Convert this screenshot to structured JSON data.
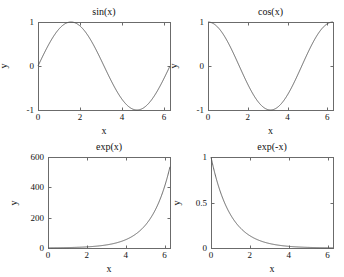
{
  "figure": {
    "background": "#ffffff",
    "line_color": "#555555",
    "axis_color": "#6b6b6b",
    "width": 344,
    "height": 277,
    "rows": 2,
    "cols": 2
  },
  "chart_data": [
    {
      "type": "line",
      "title": "sin(x)",
      "xlabel": "x",
      "ylabel": "y",
      "expression": "sin",
      "xlim": [
        0,
        6.2832
      ],
      "ylim": [
        -1,
        1
      ],
      "xticks": [
        0,
        2,
        4,
        6
      ],
      "xtick_labels": [
        "0",
        "2",
        "4",
        "6"
      ],
      "yticks": [
        -1,
        0,
        1
      ],
      "ytick_labels": [
        "-1",
        "0",
        "1"
      ],
      "grid": false,
      "legend": false,
      "box": [
        38,
        22,
        132,
        88
      ],
      "title_y": 6,
      "key_points": [
        {
          "x": 0,
          "y": 0
        },
        {
          "x": 1.5708,
          "y": 1
        },
        {
          "x": 3.1416,
          "y": 0
        },
        {
          "x": 4.7124,
          "y": -1
        },
        {
          "x": 6.2832,
          "y": 0
        }
      ]
    },
    {
      "type": "line",
      "title": "cos(x)",
      "xlabel": "x",
      "ylabel": "y",
      "expression": "cos",
      "xlim": [
        0,
        6.2832
      ],
      "ylim": [
        -1,
        1
      ],
      "xticks": [
        0,
        2,
        4,
        6
      ],
      "xtick_labels": [
        "0",
        "2",
        "4",
        "6"
      ],
      "yticks": [
        -1,
        0,
        1
      ],
      "ytick_labels": [
        "-1",
        "0",
        "1"
      ],
      "grid": false,
      "legend": false,
      "box": [
        208,
        22,
        125,
        88
      ],
      "title_y": 6,
      "key_points": [
        {
          "x": 0,
          "y": 1
        },
        {
          "x": 1.5708,
          "y": 0
        },
        {
          "x": 3.1416,
          "y": -1
        },
        {
          "x": 4.7124,
          "y": 0
        },
        {
          "x": 6.2832,
          "y": 1
        }
      ]
    },
    {
      "type": "line",
      "title": "exp(x)",
      "xlabel": "x",
      "ylabel": "y",
      "expression": "exp",
      "xlim": [
        0,
        6.2832
      ],
      "ylim": [
        0,
        600
      ],
      "xticks": [
        0,
        2,
        4,
        6
      ],
      "xtick_labels": [
        "0",
        "2",
        "4",
        "6"
      ],
      "yticks": [
        0,
        200,
        400,
        600
      ],
      "ytick_labels": [
        "0",
        "200",
        "400",
        "600"
      ],
      "grid": false,
      "legend": false,
      "box": [
        48,
        157,
        122,
        91
      ],
      "title_y": 141,
      "key_points": [
        {
          "x": 0,
          "y": 1
        },
        {
          "x": 2,
          "y": 7.39
        },
        {
          "x": 4,
          "y": 54.6
        },
        {
          "x": 6,
          "y": 403.4
        },
        {
          "x": 6.2832,
          "y": 535.5
        }
      ]
    },
    {
      "type": "line",
      "title": "exp(-x)",
      "xlabel": "x",
      "ylabel": "y",
      "expression": "negexp",
      "xlim": [
        0,
        6.2832
      ],
      "ylim": [
        0,
        1
      ],
      "xticks": [
        0,
        2,
        4,
        6
      ],
      "xtick_labels": [
        "0",
        "2",
        "4",
        "6"
      ],
      "yticks": [
        0,
        0.5,
        1
      ],
      "ytick_labels": [
        "0",
        "0.5",
        "1"
      ],
      "grid": false,
      "legend": false,
      "box": [
        211,
        157,
        122,
        91
      ],
      "title_y": 141,
      "key_points": [
        {
          "x": 0,
          "y": 1
        },
        {
          "x": 0.6931,
          "y": 0.5
        },
        {
          "x": 2,
          "y": 0.135
        },
        {
          "x": 4,
          "y": 0.018
        },
        {
          "x": 6.2832,
          "y": 0.0019
        }
      ]
    }
  ]
}
